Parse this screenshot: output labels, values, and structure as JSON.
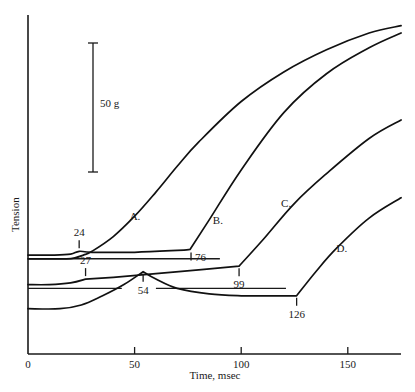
{
  "chart_data": {
    "type": "line",
    "title": "",
    "xlabel": "Time, msec",
    "ylabel": "Tension",
    "xlim": [
      0,
      175
    ],
    "xticks": [
      0,
      50,
      100,
      150
    ],
    "xtick_labels": [
      "0",
      "50",
      "100",
      "150"
    ],
    "grid": false,
    "legend": "none",
    "scale_bar": {
      "label": "50 g",
      "value_g": 50
    },
    "y_units": "g (relative, each trace offset)",
    "series": [
      {
        "name": "A.",
        "x": [
          0,
          10,
          18,
          22,
          26,
          30,
          40,
          50,
          60,
          70,
          80,
          100,
          120,
          140,
          160,
          175
        ],
        "y": [
          5,
          5,
          5,
          5.5,
          7,
          9,
          17,
          28,
          41,
          55,
          68,
          90,
          106,
          118,
          127,
          131
        ]
      },
      {
        "name": "B.",
        "x": [
          0,
          12,
          20,
          24,
          30,
          50,
          70,
          76,
          85,
          100,
          120,
          140,
          160,
          175
        ],
        "y": [
          7,
          7,
          7.5,
          9,
          8.5,
          8.5,
          9.5,
          10,
          26,
          53,
          84,
          105,
          119,
          127
        ]
      },
      {
        "name": "C.",
        "x": [
          0,
          10,
          20,
          27,
          40,
          60,
          80,
          99,
          110,
          125,
          140,
          160,
          175
        ],
        "y": [
          -9,
          -9,
          -8,
          -6,
          -5,
          -3,
          -1,
          1,
          15,
          35,
          51,
          70,
          80
        ]
      },
      {
        "name": "D.",
        "x": [
          0,
          15,
          25,
          35,
          45,
          54,
          60,
          70,
          85,
          100,
          115,
          126,
          135,
          145,
          160,
          175
        ],
        "y": [
          -22,
          -22,
          -20,
          -15,
          -9,
          -2,
          -6,
          -11,
          -14,
          -15,
          -15,
          -15,
          -2,
          11,
          27,
          38
        ]
      }
    ],
    "reference_lines": [
      {
        "name": "baseline-AB",
        "y": 5,
        "x_range": [
          0,
          90
        ]
      },
      {
        "name": "baseline-CD-left",
        "y": -11,
        "x_range": [
          0,
          44
        ]
      },
      {
        "name": "baseline-CD-right",
        "y": -11,
        "x_range": [
          60,
          121
        ]
      }
    ],
    "annotations": [
      {
        "label": "24",
        "x": 24,
        "series": "B."
      },
      {
        "label": "76",
        "x": 76,
        "series": "B."
      },
      {
        "label": "27",
        "x": 27,
        "series": "C."
      },
      {
        "label": "99",
        "x": 99,
        "series": "C."
      },
      {
        "label": "54",
        "x": 54,
        "series": "D."
      },
      {
        "label": "126",
        "x": 126,
        "series": "D."
      }
    ]
  }
}
